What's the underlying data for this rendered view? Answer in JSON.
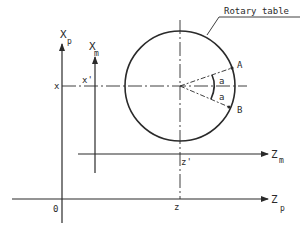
{
  "diagram": {
    "title_callout": "Rotary table",
    "axes": {
      "xp": {
        "label": "X",
        "subscript": "p"
      },
      "xm": {
        "label": "X",
        "subscript": "m"
      },
      "zm": {
        "label": "Z",
        "subscript": "m"
      },
      "zp": {
        "label": "Z",
        "subscript": "p"
      }
    },
    "coordinate_labels": {
      "x": "x",
      "x_prime": "x'",
      "z": "z",
      "z_prime": "z'",
      "origin": "0"
    },
    "points": {
      "A": "A",
      "B": "B"
    },
    "angles": {
      "upper": "a",
      "lower": "a"
    },
    "colors": {
      "stroke": "#2a2a2a",
      "background": "#ffffff"
    }
  }
}
